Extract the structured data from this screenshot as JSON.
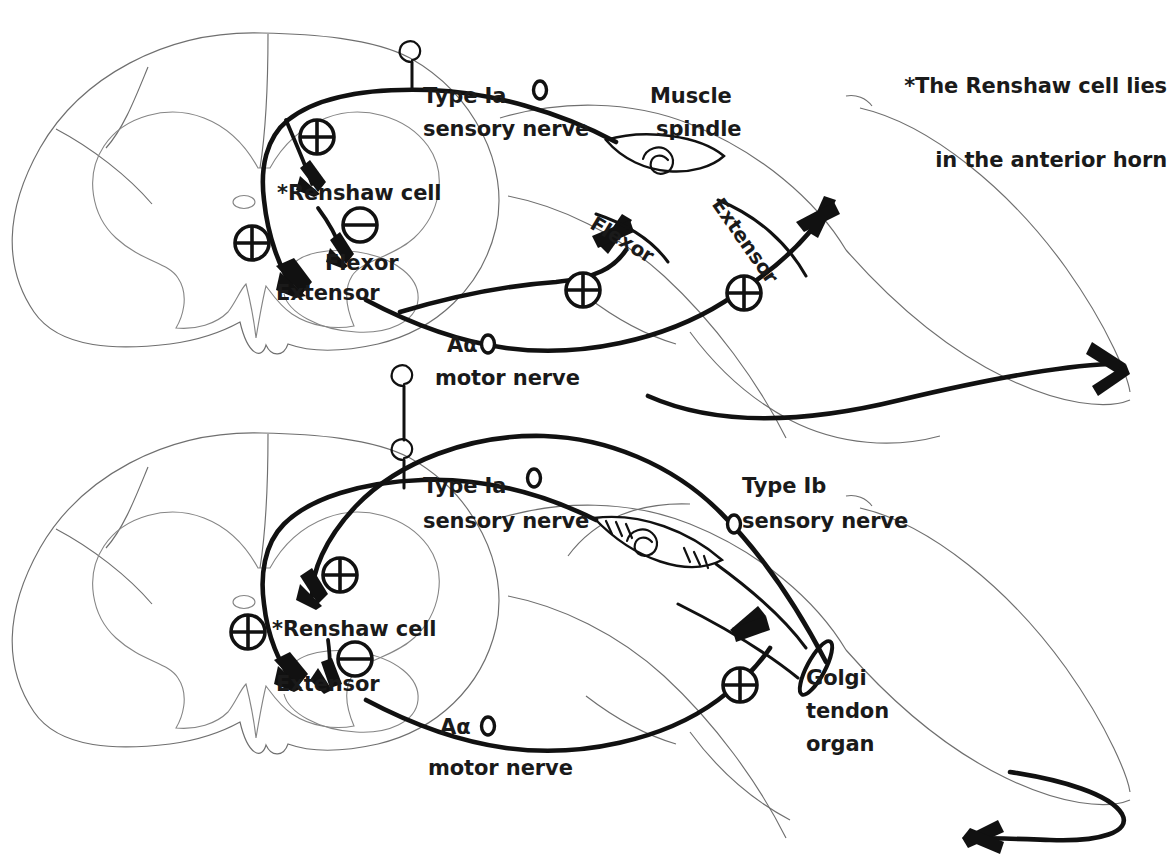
{
  "figure": {
    "title_note": {
      "line1": "*The Renshaw cell lies",
      "line2": "in the anterior horn"
    },
    "symbols": {
      "excitatory": "⊕",
      "inhibitory": "⊖",
      "excitatory_name": "plus-circle-symbol",
      "inhibitory_name": "minus-circle-symbol"
    },
    "panels": [
      {
        "id": "upper-panel",
        "name": "reciprocal-inhibition-stretch-reflex",
        "labels": {
          "sensory_nerve_l1": "Type Ia",
          "sensory_nerve_l2": "sensory nerve",
          "muscle_receptor_l1": "Muscle",
          "muscle_receptor_l2": "spindle",
          "renshaw_cell": "*Renshaw cell",
          "flexor_neuron": "Flexor",
          "extensor_neuron": "Extensor",
          "muscle_flexor": "Flexor",
          "muscle_extensor": "Extensor",
          "motor_nerve_l1": "Aα",
          "motor_nerve_l2": "motor nerve"
        },
        "synapses": [
          {
            "type": "excitatory",
            "target": "renshaw-cell"
          },
          {
            "type": "excitatory",
            "target": "extensor-motor-neuron"
          },
          {
            "type": "inhibitory",
            "target": "flexor-motor-neuron"
          },
          {
            "type": "excitatory",
            "target": "flexor-muscle"
          },
          {
            "type": "excitatory",
            "target": "extensor-muscle"
          }
        ]
      },
      {
        "id": "lower-panel",
        "name": "golgi-tendon-organ-reflex",
        "labels": {
          "sensory_nerve_ia_l1": "Type Ia",
          "sensory_nerve_ia_l2": "sensory nerve",
          "sensory_nerve_ib_l1": "Type Ib",
          "sensory_nerve_ib_l2": "sensory nerve",
          "renshaw_cell": "*Renshaw cell",
          "extensor_neuron": "Extensor",
          "golgi_l1": "Golgi",
          "golgi_l2": "tendon",
          "golgi_l3": "organ",
          "motor_nerve_l1": "Aα",
          "motor_nerve_l2": "motor nerve"
        },
        "synapses": [
          {
            "type": "excitatory",
            "target": "renshaw-cell"
          },
          {
            "type": "excitatory",
            "target": "extensor-motor-neuron"
          },
          {
            "type": "inhibitory",
            "target": "extensor-motor-neuron"
          },
          {
            "type": "excitatory",
            "target": "extensor-muscle"
          }
        ]
      }
    ],
    "colors": {
      "ink": "#111111",
      "outline": "#6f6f6f",
      "background": "#ffffff"
    }
  }
}
